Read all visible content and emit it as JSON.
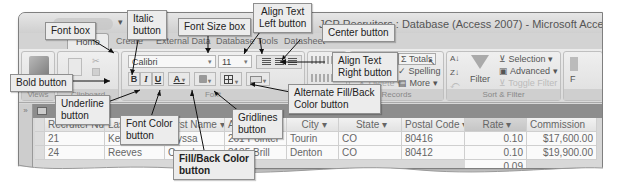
{
  "window": {
    "title": "JCP Recruiters : Database (Access 2007) - Microsoft Access",
    "office_button": "office-button"
  },
  "tabs": [
    {
      "label": "Home",
      "active": true
    },
    {
      "label": "Create",
      "active": false
    },
    {
      "label": "External Data",
      "active": false
    },
    {
      "label": "Database Tools",
      "active": false
    },
    {
      "label": "Datasheet",
      "active": false
    }
  ],
  "ribbon": {
    "groups": {
      "views": {
        "label": "Views"
      },
      "clipboard": {
        "label": "Clipboard"
      },
      "font": {
        "label": "Font"
      },
      "rich_text": {
        "label": "Rich Text"
      },
      "records": {
        "label": "Records"
      },
      "sort_filter": {
        "label": "Sort & Filter"
      }
    },
    "font_box": {
      "value": "Calibri"
    },
    "font_size_box": {
      "value": "11"
    },
    "format_buttons": {
      "bold": "B",
      "italic": "I",
      "underline": "U",
      "font_color": "A"
    },
    "records": {
      "refresh": "Refresh",
      "new": "New",
      "save": "Save",
      "delete": "Delete",
      "totals": "Totals",
      "spelling": "Spelling",
      "more": "More"
    },
    "sort_filter": {
      "filter": "Filter",
      "selection": "Selection",
      "advanced": "Advanced",
      "toggle_filter": "Toggle Filter"
    },
    "find_partial": "F"
  },
  "nav_pane": {
    "toggle": "»"
  },
  "table": {
    "columns": [
      {
        "label": "Recruiter Nu",
        "sort": "▾"
      },
      {
        "label": "Last Name",
        "sort": "▾"
      },
      {
        "label": "First Name",
        "sort": "▾"
      },
      {
        "label": "Address",
        "sort": "▾"
      },
      {
        "label": "City",
        "sort": "▾"
      },
      {
        "label": "State",
        "sort": "▾"
      },
      {
        "label": "Postal Code",
        "sort": "▾"
      },
      {
        "label": "Rate",
        "sort": "▾"
      },
      {
        "label": "Commission",
        "sort": ""
      }
    ],
    "rows": [
      [
        "21",
        "Kerry",
        "Alyssa",
        "261 Pointer",
        "Tourin",
        "CO",
        "80416",
        "0.10",
        "$17,600.00"
      ],
      [
        "24",
        "Reeves",
        "Camden",
        "3135 Brill",
        "Denton",
        "CO",
        "80412",
        "0.10",
        "$19,900.00"
      ],
      [
        "",
        "",
        "",
        "",
        "",
        "",
        "",
        "0.09",
        ""
      ]
    ]
  },
  "callouts": {
    "font_box": "Font box",
    "italic": "Italic\nbutton",
    "font_size_box": "Font Size box",
    "align_left": "Align Text\nLeft button",
    "center": "Center button",
    "align_right": "Align Text\nRight button",
    "bold": "Bold button",
    "underline": "Underline\nbutton",
    "font_color": "Font Color\nbutton",
    "gridlines": "Gridlines\nbutton",
    "alt_fill": "Alternate Fill/Back\nColor button",
    "fill_back": "Fill/Back Color\nbutton"
  }
}
